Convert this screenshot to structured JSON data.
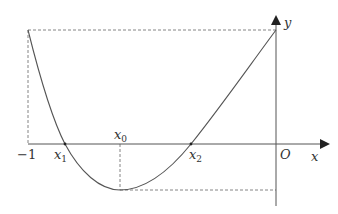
{
  "diagram": {
    "type": "function-graph",
    "axes": {
      "x_label": "x",
      "y_label": "y",
      "origin_label": "O"
    },
    "labels": {
      "neg_one": "−1",
      "x1_base": "x",
      "x1_sub": "1",
      "x0_base": "x",
      "x0_sub": "0",
      "x2_base": "x",
      "x2_sub": "2"
    },
    "colors": {
      "curve": "#555555",
      "axis": "#555555",
      "dashed": "#777777",
      "text": "#333333"
    }
  }
}
